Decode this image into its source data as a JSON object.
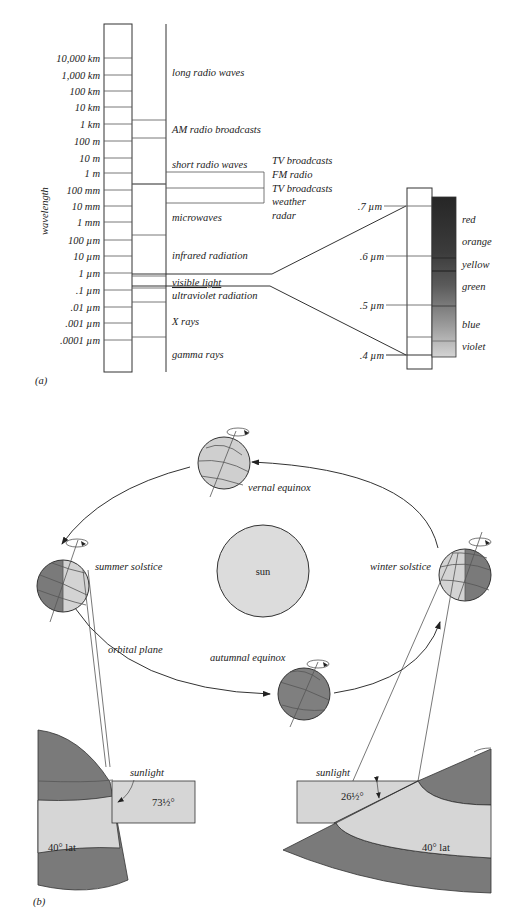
{
  "part_a": {
    "panel_label": "(a)",
    "axis_label": "wavelength",
    "wavelength_ticks": [
      "10,000 km",
      "1,000 km",
      "100 km",
      "10 km",
      "1 km",
      "100 m",
      "10 m",
      "1 m",
      "100 mm",
      "10 mm",
      "1 mm",
      "100 µm",
      "10 µm",
      "1 µm",
      ".1 µm",
      ".01 µm",
      ".001 µm",
      ".0001 µm"
    ],
    "bands": [
      {
        "label": "long radio waves"
      },
      {
        "label": "AM radio broadcasts"
      },
      {
        "label": "short radio waves"
      },
      {
        "label": "microwaves"
      },
      {
        "label": "infrared radiation"
      },
      {
        "label": "visible light"
      },
      {
        "label": "ultraviolet radiation"
      },
      {
        "label": "X rays"
      },
      {
        "label": "gamma rays"
      }
    ],
    "sub_bands": [
      "TV broadcasts",
      "FM radio",
      "TV broadcasts",
      "weather",
      "radar"
    ],
    "visible_ticks": [
      ".7 µm",
      ".6 µm",
      ".5 µm",
      ".4 µm"
    ],
    "visible_colors": [
      {
        "label": "red",
        "shade": "#2a2a2a"
      },
      {
        "label": "orange",
        "shade": "#3a3a3a"
      },
      {
        "label": "yellow",
        "shade": "#4a4a4a"
      },
      {
        "label": "green",
        "shade": "#6a6a6a"
      },
      {
        "label": "blue",
        "shade": "#999999"
      },
      {
        "label": "violet",
        "shade": "#c8c8c8"
      }
    ]
  },
  "part_b": {
    "panel_label": "(b)",
    "sun_label": "sun",
    "positions": {
      "vernal": "vernal equinox",
      "summer": "summer solstice",
      "autumnal": "autumnal equinox",
      "winter": "winter solstice"
    },
    "orbital_plane": "orbital plane",
    "summer_inset": {
      "sunlight": "sunlight",
      "angle": "73½°",
      "lat": "40° lat"
    },
    "winter_inset": {
      "sunlight": "sunlight",
      "angle": "26½°",
      "lat": "40° lat"
    }
  }
}
